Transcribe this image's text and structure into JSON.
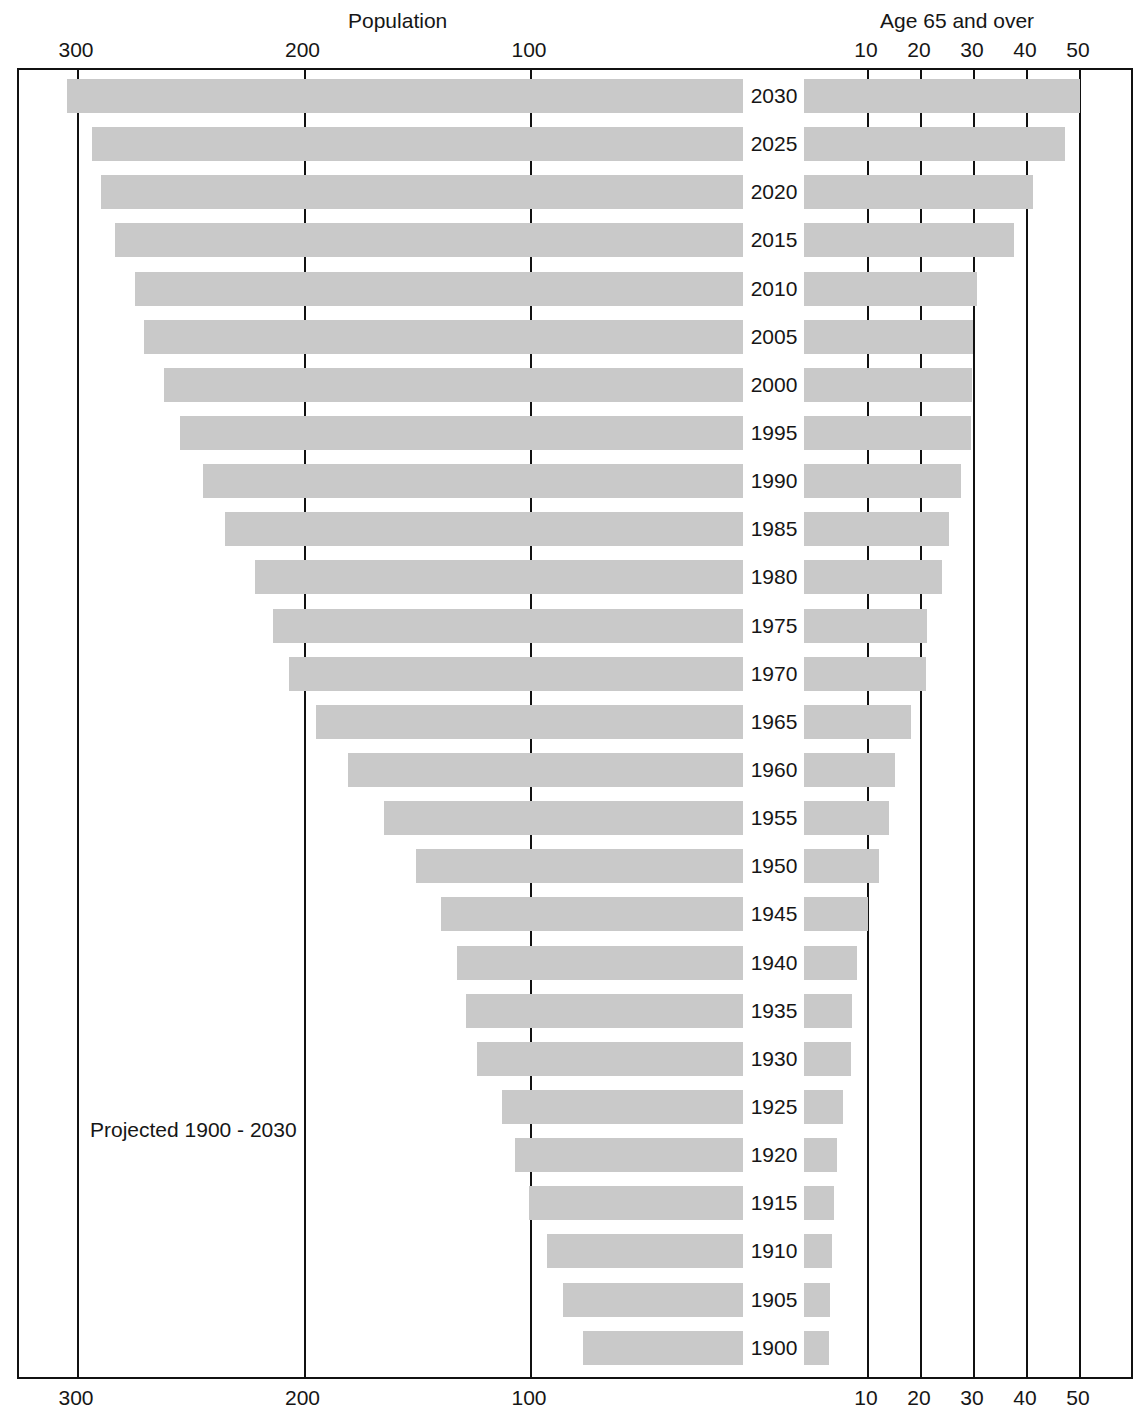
{
  "header": {
    "left_axis_title": "Population",
    "right_axis_title": "Age 65 and over"
  },
  "annotation": {
    "projected_note": "Projected 1900 - 2030"
  },
  "axes": {
    "left_ticks": [
      "300",
      "200",
      "100"
    ],
    "right_ticks": [
      "10",
      "20",
      "30",
      "40",
      "50"
    ]
  },
  "chart_data": {
    "type": "bar",
    "title": "",
    "subtitle": "Projected 1900 - 2030",
    "orientation": "horizontal",
    "layout": "back-to-back bidirectional (butterfly) bar chart; left panel axis decreases left-to-right, right panel axis increases left-to-right; year labels in the centre gutter",
    "grid": true,
    "legend_position": "none",
    "panels": [
      {
        "name": "Population",
        "side": "left",
        "xlabel": "Population",
        "unit": "millions",
        "tick_values": [
          300,
          200,
          100
        ],
        "xlim": [
          320,
          0
        ],
        "direction": "decreasing-rightward"
      },
      {
        "name": "Age 65 and over",
        "side": "right",
        "xlabel": "Age 65 and over",
        "unit": "millions",
        "tick_values": [
          10,
          20,
          30,
          40,
          50
        ],
        "xlim": [
          0,
          57
        ],
        "direction": "increasing-rightward"
      }
    ],
    "categories": [
      "2030",
      "2025",
      "2020",
      "2015",
      "2010",
      "2005",
      "2000",
      "1995",
      "1990",
      "1985",
      "1980",
      "1975",
      "1970",
      "1965",
      "1960",
      "1955",
      "1950",
      "1945",
      "1940",
      "1935",
      "1930",
      "1925",
      "1920",
      "1915",
      "1910",
      "1905",
      "1900"
    ],
    "series": [
      {
        "name": "Population",
        "panel": "left",
        "values": [
          304,
          293,
          289,
          283,
          274,
          270,
          261,
          254,
          244,
          234,
          221,
          213,
          206,
          194,
          180,
          164,
          150,
          139,
          132,
          128,
          123,
          112,
          106,
          100,
          92,
          85,
          76
        ]
      },
      {
        "name": "Age 65 and over",
        "panel": "right",
        "values": [
          50.3,
          47.5,
          41.5,
          38.0,
          31.0,
          30.2,
          30.0,
          29.8,
          28.0,
          25.7,
          24.3,
          21.5,
          21.3,
          18.4,
          15.5,
          14.4,
          12.5,
          10.4,
          8.3,
          7.3,
          7.2,
          5.6,
          4.5,
          4.0,
          3.5,
          3.2,
          3.0
        ]
      }
    ]
  },
  "colors": {
    "bar_fill": "#c9c9c9",
    "axis_line": "#111111",
    "text": "#161616",
    "background": "#ffffff"
  }
}
